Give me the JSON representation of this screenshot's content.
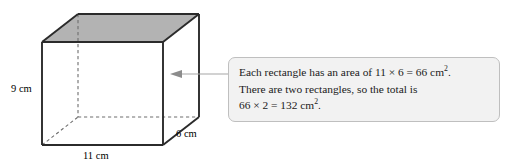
{
  "figure": {
    "type": "cuboid-surface-area-diagram",
    "shape_name": "cuboid",
    "labels": {
      "height": "9 cm",
      "width": "11 cm",
      "depth": "6 cm"
    },
    "dimensions": {
      "height_value": 9,
      "width_value": 11,
      "depth_value": 6,
      "unit": "cm"
    },
    "colors": {
      "face_shading": "#b3b3b3",
      "front_face": "#ffffff",
      "edge": "#2b2b2b",
      "hidden_edge": "#6e6e6e",
      "callout_fill": "#f2f2f2",
      "callout_border": "#bfbfbf",
      "arrow": "#a6a6a6",
      "text": "#1a1a1a"
    }
  },
  "callout": {
    "lines": [
      "Each rectangle has an area of 11 × 6 = 66 cm².",
      "There are two rectangles, so the total is",
      "66 × 2 = 132 cm²."
    ],
    "line1_prefix": "Each rectangle has an area of 11 × 6 = 66 cm",
    "line1_suffix": ".",
    "line2": "There are two rectangles, so the total is",
    "line3_prefix": "66 × 2 = 132 cm",
    "line3_suffix": ".",
    "superscript": "2"
  },
  "annotation": {
    "arrow_label": "pointer from explanation to right face of cuboid",
    "arrow_direction": "left"
  }
}
